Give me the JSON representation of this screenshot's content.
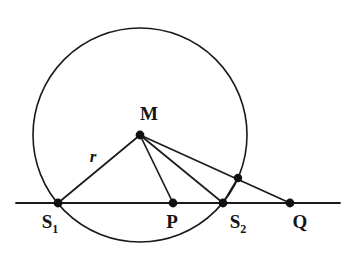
{
  "figure": {
    "canvas": {
      "width": 348,
      "height": 259,
      "background": "#ffffff"
    },
    "stroke_color": "#1a1a1a",
    "point_color": "#111111",
    "circle": {
      "name": "circle-m",
      "center_label": "M",
      "cx": 140,
      "cy": 135,
      "r": 107,
      "stroke_width": 1.6
    },
    "secant_line": {
      "name": "secant-line",
      "x1": 16,
      "y1": 203,
      "x2": 340,
      "y2": 203,
      "stroke_width": 1.8
    },
    "radius_label": "r",
    "points": [
      {
        "id": "M",
        "label": "M",
        "sub": "",
        "x": 140,
        "y": 135,
        "label_x": 149,
        "label_y": 120,
        "dot_r": 4.4
      },
      {
        "id": "S1",
        "label": "S",
        "sub": "1",
        "x": 58,
        "y": 203,
        "label_x": 50,
        "label_y": 228,
        "dot_r": 4.4
      },
      {
        "id": "P",
        "label": "P",
        "sub": "",
        "x": 173,
        "y": 203,
        "label_x": 172,
        "label_y": 228,
        "dot_r": 4.4
      },
      {
        "id": "S2",
        "label": "S",
        "sub": "2",
        "x": 223,
        "y": 203,
        "label_x": 238,
        "label_y": 228,
        "dot_r": 4.4
      },
      {
        "id": "Q",
        "label": "Q",
        "sub": "",
        "x": 290,
        "y": 203,
        "label_x": 300,
        "label_y": 228,
        "dot_r": 4.4
      },
      {
        "id": "T",
        "label": "",
        "sub": "",
        "x": 238,
        "y": 178,
        "label_x": 0,
        "label_y": 0,
        "dot_r": 4.2
      }
    ],
    "segments": [
      {
        "name": "segment-m-s1",
        "from": "M",
        "to": "S1",
        "x1": 140,
        "y1": 135,
        "x2": 58,
        "y2": 203,
        "stroke_width": 1.7
      },
      {
        "name": "segment-m-p",
        "from": "M",
        "to": "P",
        "x1": 140,
        "y1": 135,
        "x2": 173,
        "y2": 203,
        "stroke_width": 1.7
      },
      {
        "name": "segment-m-s2",
        "from": "M",
        "to": "S2",
        "x1": 140,
        "y1": 135,
        "x2": 223,
        "y2": 203,
        "stroke_width": 1.7
      },
      {
        "name": "segment-m-q",
        "from": "M",
        "to": "Q",
        "x1": 140,
        "y1": 135,
        "x2": 290,
        "y2": 203,
        "stroke_width": 1.7
      },
      {
        "name": "segment-s2-t",
        "from": "S2",
        "to": "T",
        "x1": 223,
        "y1": 203,
        "x2": 238,
        "y2": 178,
        "stroke_width": 1.7
      }
    ],
    "radius_label_pos": {
      "x": 93,
      "y": 162
    }
  }
}
